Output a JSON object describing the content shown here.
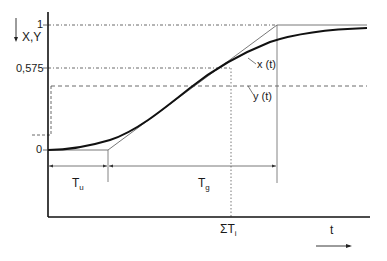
{
  "diagram": {
    "type": "step-response-tangent-method",
    "y_axis_label": "X,Y",
    "y_axis_arrow": "down-arrow",
    "x_axis_label": "t",
    "x_axis_arrow": "right-arrow",
    "levels": {
      "one": "1",
      "fraction": "0,575",
      "zero": "0"
    },
    "curves": {
      "x_label": "x (t)",
      "y_label": "y (t)"
    },
    "intervals": {
      "tu_main": "T",
      "tu_sub": "u",
      "tg_main": "T",
      "tg_sub": "g",
      "sum_main": "ΣT",
      "sum_sub": "i"
    },
    "colors": {
      "axis": "#111111",
      "curve": "#111111",
      "thin": "#555555",
      "dashed": "#444444"
    }
  }
}
